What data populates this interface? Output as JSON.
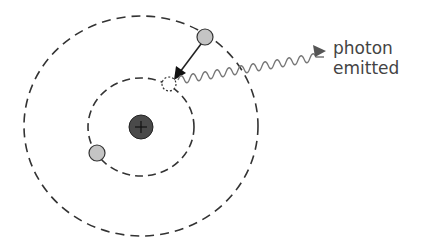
{
  "diagram": {
    "type": "bohr-atom-photon-emission",
    "labels": {
      "line1": "photon",
      "line2": "emitted"
    },
    "nucleus_symbol": "+",
    "colors": {
      "orbit": "#333333",
      "electron": "#c4c4c4",
      "nucleus": "#4a4a4a",
      "wave": "#777777",
      "text": "#444444"
    }
  }
}
